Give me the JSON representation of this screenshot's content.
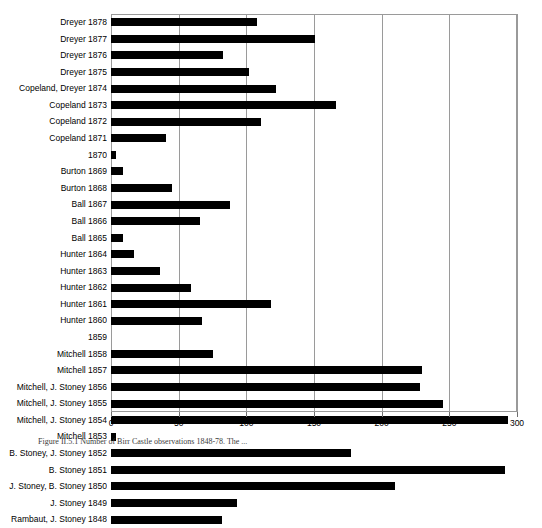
{
  "figure": {
    "caption": "Figure II.5.1 Number of Birr Castle observations 1848-78. The ..."
  },
  "chart_data": {
    "type": "bar",
    "orientation": "horizontal",
    "title": "",
    "xlabel": "",
    "ylabel": "",
    "xlim": [
      0,
      300
    ],
    "xticks": [
      0,
      50,
      100,
      150,
      200,
      250,
      300
    ],
    "xtick_labels": [
      "0",
      "50",
      "100",
      "150",
      "200",
      "250",
      "300"
    ],
    "grid": "vertical",
    "legend": "none",
    "bar_color": "#000000",
    "categories": [
      "Dreyer 1878",
      "Dreyer 1877",
      "Dreyer 1876",
      "Dreyer 1875",
      "Copeland, Dreyer 1874",
      "Copeland 1873",
      "Copeland 1872",
      "Copeland 1871",
      "1870",
      "Burton 1869",
      "Burton 1868",
      "Ball 1867",
      "Ball 1866",
      "Ball 1865",
      "Hunter 1864",
      "Hunter 1863",
      "Hunter 1862",
      "Hunter 1861",
      "Hunter 1860",
      "1859",
      "Mitchell 1858",
      "Mitchell 1857",
      "Mitchell, J. Stoney 1856",
      "Mitchell, J. Stoney 1855",
      "Mitchell, J. Stoney 1854",
      "Mitchell 1853",
      "B. Stoney, J. Stoney 1852",
      "B. Stoney 1851",
      "J. Stoney, B. Stoney 1850",
      "J. Stoney 1849",
      "Rambaut, J. Stoney 1848"
    ],
    "values": [
      108,
      151,
      83,
      102,
      122,
      166,
      111,
      41,
      4,
      9,
      45,
      88,
      66,
      9,
      17,
      36,
      59,
      118,
      67,
      0,
      75,
      230,
      228,
      245,
      293,
      4,
      177,
      291,
      210,
      93,
      82
    ]
  }
}
